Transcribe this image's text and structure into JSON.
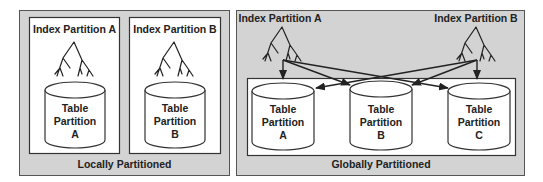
{
  "colors": {
    "panel_fill": "#d3d3d3",
    "inner_fill": "#ffffff",
    "stroke": "#333333",
    "text": "#222222"
  },
  "local": {
    "caption": "Locally Partitioned",
    "indexes": [
      {
        "label": "Index Partition A"
      },
      {
        "label": "Index Partition B"
      }
    ],
    "tables": [
      {
        "line1": "Table",
        "line2": "Partition",
        "line3": "A"
      },
      {
        "line1": "Table",
        "line2": "Partition",
        "line3": "B"
      }
    ]
  },
  "global": {
    "caption": "Globally Partitioned",
    "indexes": [
      {
        "label": "Index Partition A"
      },
      {
        "label": "Index Partition B"
      }
    ],
    "tables": [
      {
        "line1": "Table",
        "line2": "Partition",
        "line3": "A"
      },
      {
        "line1": "Table",
        "line2": "Partition",
        "line3": "B"
      },
      {
        "line1": "Table",
        "line2": "Partition",
        "line3": "C"
      }
    ],
    "edges": [
      {
        "from": "Index Partition A",
        "to": "Table Partition A"
      },
      {
        "from": "Index Partition A",
        "to": "Table Partition B"
      },
      {
        "from": "Index Partition A",
        "to": "Table Partition C"
      },
      {
        "from": "Index Partition B",
        "to": "Table Partition A"
      },
      {
        "from": "Index Partition B",
        "to": "Table Partition B"
      },
      {
        "from": "Index Partition B",
        "to": "Table Partition C"
      }
    ]
  }
}
